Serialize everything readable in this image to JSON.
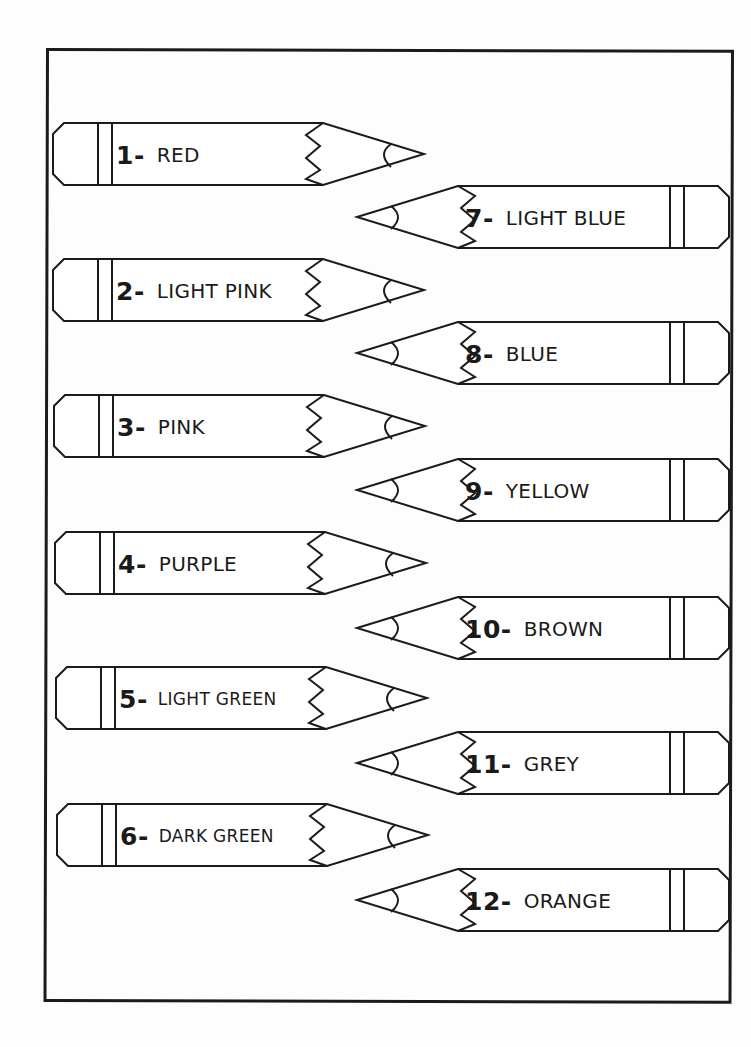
{
  "worksheet": {
    "pencils_left": [
      {
        "number": "1-",
        "name": "RED",
        "size": "normal"
      },
      {
        "number": "2-",
        "name": "LIGHT PINK",
        "size": "normal"
      },
      {
        "number": "3-",
        "name": "PINK",
        "size": "normal"
      },
      {
        "number": "4-",
        "name": "PURPLE",
        "size": "normal"
      },
      {
        "number": "5-",
        "name": "LIGHT GREEN",
        "size": "small"
      },
      {
        "number": "6-",
        "name": "DARK GREEN",
        "size": "small"
      }
    ],
    "pencils_right": [
      {
        "number": "7-",
        "name": "LIGHT BLUE",
        "size": "normal"
      },
      {
        "number": "8-",
        "name": "BLUE",
        "size": "normal"
      },
      {
        "number": "9-",
        "name": "YELLOW",
        "size": "normal"
      },
      {
        "number": "10-",
        "name": "BROWN",
        "size": "normal"
      },
      {
        "number": "11-",
        "name": "GREY",
        "size": "normal"
      },
      {
        "number": "12-",
        "name": "ORANGE",
        "size": "normal"
      }
    ],
    "colors": {
      "outline": "#1b1b1b",
      "paper": "#fdfdfd"
    }
  }
}
